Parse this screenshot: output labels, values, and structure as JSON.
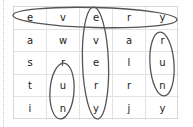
{
  "puzzle": {
    "type": "word-search",
    "grid": [
      [
        "e",
        "v",
        "e",
        "r",
        "y"
      ],
      [
        "a",
        "w",
        "v",
        "a",
        "r"
      ],
      [
        "s",
        "r",
        "e",
        "l",
        "u"
      ],
      [
        "t",
        "u",
        "r",
        "r",
        "n"
      ],
      [
        "i",
        "n",
        "y",
        "j",
        "y"
      ]
    ],
    "circled_words": [
      {
        "word": "every",
        "direction": "horizontal",
        "row": 0,
        "col_start": 0,
        "col_end": 4
      },
      {
        "word": "every",
        "direction": "vertical",
        "col": 2,
        "row_start": 0,
        "row_end": 4
      },
      {
        "word": "run",
        "direction": "vertical",
        "col": 1,
        "row_start": 2,
        "row_end": 4
      },
      {
        "word": "run",
        "direction": "vertical",
        "col": 4,
        "row_start": 1,
        "row_end": 3
      }
    ],
    "colors": {
      "circle": "#555555",
      "grid_line": "#e2e2e2",
      "text": "#222222"
    }
  }
}
